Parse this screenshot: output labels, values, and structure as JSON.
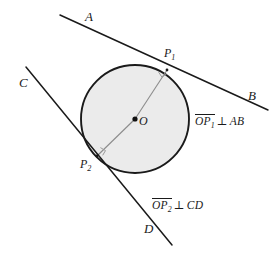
{
  "figure": {
    "background_color": "#ffffff",
    "stroke_color": "#1a1a1a",
    "circle_fill_color": "#ebebeb",
    "radius_line_color": "#8c8c8c",
    "circle": {
      "center_label": "O",
      "center_x": 135,
      "center_y": 119,
      "radius": 54
    },
    "points": [
      {
        "id": "center",
        "label": "O",
        "x": 135,
        "y": 119
      },
      {
        "id": "p1",
        "label_main": "P",
        "label_sub": "1",
        "x": 167,
        "y": 70
      },
      {
        "id": "p2",
        "label_main": "P",
        "label_sub": "2",
        "x": 97,
        "y": 156
      }
    ],
    "lines": [
      {
        "id": "ab",
        "endpoint_start_label": "A",
        "endpoint_end_label": "B",
        "x1": 60,
        "y1": 15,
        "x2": 268,
        "y2": 110
      },
      {
        "id": "cd",
        "endpoint_start_label": "C",
        "endpoint_end_label": "D",
        "x1": 26,
        "y1": 67,
        "x2": 172,
        "y2": 245
      }
    ],
    "radii": [
      {
        "id": "o-p1",
        "x1": 135,
        "y1": 119,
        "x2": 167,
        "y2": 70
      },
      {
        "id": "o-p2",
        "x1": 135,
        "y1": 119,
        "x2": 97,
        "y2": 156
      }
    ],
    "right_angle_marks": [
      {
        "id": "right-angle-p1",
        "at_x": 167,
        "at_y": 70
      },
      {
        "id": "right-angle-p2",
        "at_x": 97,
        "at_y": 156
      }
    ],
    "labels": {
      "a": "A",
      "b": "B",
      "c": "C",
      "d": "D",
      "o": "O",
      "p1_main": "P",
      "p1_sub": "1",
      "p2_main": "P",
      "p2_sub": "2"
    },
    "annotations": [
      {
        "id": "perp-ab",
        "segment_main": "OP",
        "segment_sub": "1",
        "relation": "⊥",
        "line_name": "AB",
        "text": "OP1 ⊥ AB",
        "x": 195,
        "y": 114
      },
      {
        "id": "perp-cd",
        "segment_main": "OP",
        "segment_sub": "2",
        "relation": "⊥",
        "line_name": "CD",
        "text": "OP2 ⊥ CD",
        "x": 152,
        "y": 198
      }
    ]
  }
}
